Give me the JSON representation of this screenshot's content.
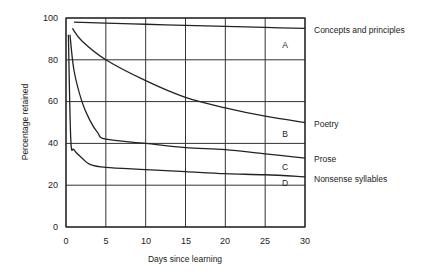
{
  "chart_data": {
    "type": "line",
    "title": "",
    "xlabel": "Days since learning",
    "ylabel": "Percentage retained",
    "xlim": [
      0,
      30
    ],
    "ylim": [
      0,
      100
    ],
    "xticks": [
      "0",
      "5",
      "10",
      "15",
      "20",
      "25",
      "30"
    ],
    "yticks": [
      "0",
      "20",
      "40",
      "60",
      "80",
      "100"
    ],
    "grid": true,
    "legend_position": "right, inline labels",
    "series": [
      {
        "name": "Concepts and principles",
        "region": "A",
        "x": [
          1,
          5,
          10,
          15,
          20,
          25,
          30
        ],
        "values": [
          98,
          97.5,
          97,
          96.5,
          96,
          95.5,
          95
        ]
      },
      {
        "name": "Poetry",
        "region": "B",
        "x": [
          0.8,
          2,
          5,
          10,
          15,
          20,
          25,
          30
        ],
        "values": [
          95,
          89,
          80,
          70,
          62,
          57,
          53,
          50
        ]
      },
      {
        "name": "Prose",
        "region": "C",
        "x": [
          0.5,
          1,
          2,
          3,
          4,
          5,
          10,
          15,
          20,
          25,
          30
        ],
        "values": [
          92,
          75,
          60,
          51,
          45,
          42,
          40,
          38,
          37,
          35,
          33
        ]
      },
      {
        "name": "Nonsense syllables",
        "region": "D",
        "x": [
          0.3,
          0.6,
          1,
          2,
          3,
          5,
          10,
          15,
          20,
          25,
          30
        ],
        "values": [
          92,
          42,
          37,
          33,
          30,
          28.5,
          27.5,
          26.5,
          25.5,
          25,
          24
        ]
      }
    ],
    "region_labels": [
      "A",
      "B",
      "C",
      "D"
    ]
  },
  "labels": {
    "xlabel": "Days since learning",
    "ylabel": "Percentage retained",
    "series": [
      "Concepts and principles",
      "Poetry",
      "Prose",
      "Nonsense syllables"
    ],
    "regions": [
      "A",
      "B",
      "C",
      "D"
    ],
    "xticks": [
      "0",
      "5",
      "10",
      "15",
      "20",
      "25",
      "30"
    ],
    "yticks": [
      "0",
      "20",
      "40",
      "60",
      "80",
      "100"
    ]
  }
}
